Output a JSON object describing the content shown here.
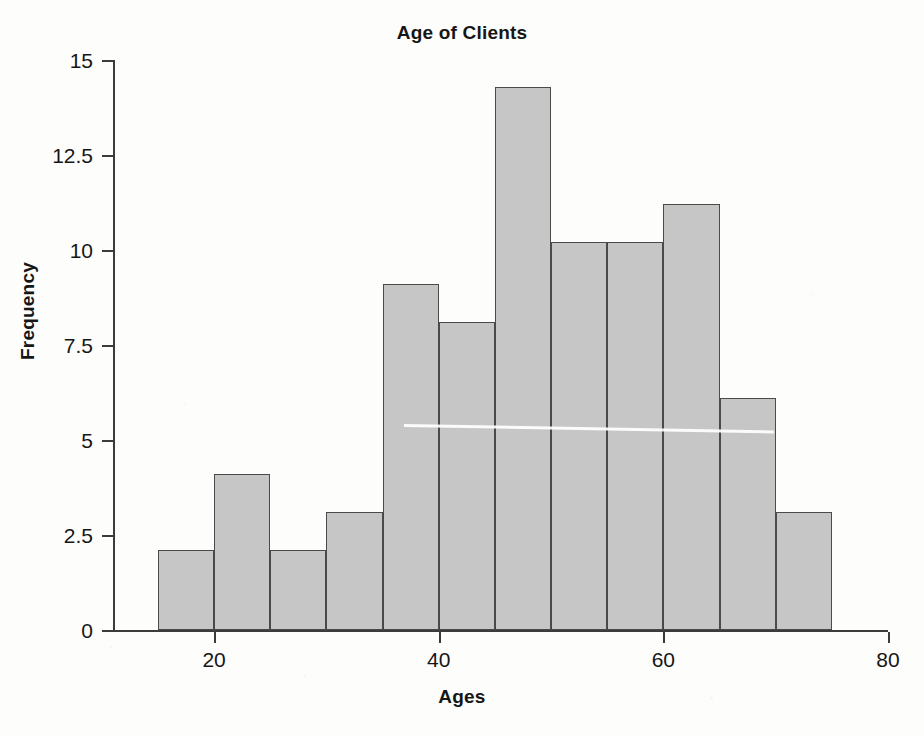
{
  "chart_data": {
    "type": "bar",
    "title": "Age of Clients",
    "xlabel": "Ages",
    "ylabel": "Frequency",
    "xlim": [
      11,
      80
    ],
    "ylim": [
      0,
      15
    ],
    "grid": false,
    "legend": null,
    "bin_width": 5,
    "categories": [
      "15-20",
      "20-25",
      "25-30",
      "30-35",
      "35-40",
      "40-45",
      "45-50",
      "50-55",
      "55-60",
      "60-65",
      "65-70",
      "70-75"
    ],
    "bin_edges": [
      15,
      20,
      25,
      30,
      35,
      40,
      45,
      50,
      55,
      60,
      65,
      70,
      75
    ],
    "values": [
      2.1,
      4.1,
      2.1,
      3.1,
      9.1,
      8.1,
      14.3,
      10.2,
      10.2,
      11.2,
      6.1,
      3.1
    ],
    "xticks": [
      20,
      40,
      60,
      80
    ],
    "xtick_labels": [
      "20",
      "40",
      "60",
      "80"
    ],
    "yticks": [
      0,
      2.5,
      5,
      7.5,
      10,
      12.5,
      15
    ],
    "ytick_labels": [
      "0",
      "2.5",
      "5",
      "7.5",
      "10",
      "12.5",
      "15"
    ],
    "bar_fill_color": "#c6c6c6",
    "bar_edge_color": "#4a4a4a",
    "axis_color": "#3b3b3b",
    "text_color": "#161616"
  }
}
